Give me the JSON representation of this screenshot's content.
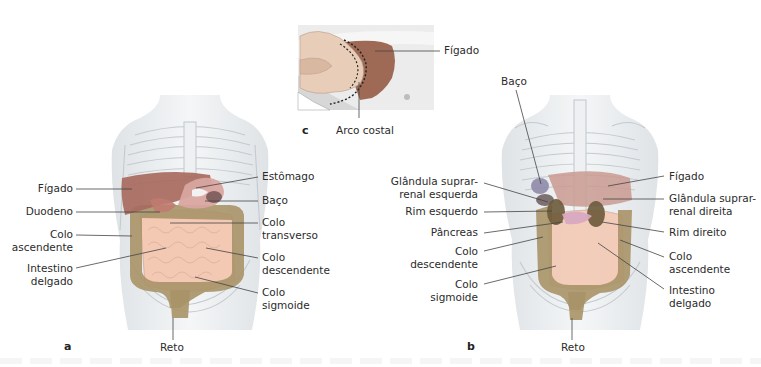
{
  "figure": {
    "panels": {
      "a": {
        "letter": "a",
        "labels_left": [
          {
            "id": "figado",
            "text": "Fígado"
          },
          {
            "id": "duodeno",
            "text": "Duodeno"
          },
          {
            "id": "colo_ascendente",
            "line1": "Colo",
            "line2": "ascendente"
          },
          {
            "id": "intestino_delgado",
            "line1": "Intestino",
            "line2": "delgado"
          }
        ],
        "labels_right": [
          {
            "id": "estomago",
            "text": "Estômago"
          },
          {
            "id": "baco",
            "text": "Baço"
          },
          {
            "id": "colo_transverso",
            "line1": "Colo",
            "line2": "transverso"
          },
          {
            "id": "colo_descendente",
            "line1": "Colo",
            "line2": "descendente"
          },
          {
            "id": "colo_sigmoide",
            "line1": "Colo",
            "line2": "sigmoide"
          }
        ],
        "label_bottom": {
          "id": "reto",
          "text": "Reto"
        }
      },
      "b": {
        "letter": "b",
        "label_top": {
          "id": "baco",
          "text": "Baço"
        },
        "labels_left": [
          {
            "id": "glandula_suprarrenal_esquerda",
            "line1": "Glândula suprar-",
            "line2": "renal esquerda"
          },
          {
            "id": "rim_esquerdo",
            "text": "Rim esquerdo"
          },
          {
            "id": "pancreas",
            "text": "Pâncreas"
          },
          {
            "id": "colo_descendente",
            "line1": "Colo",
            "line2": "descendente"
          },
          {
            "id": "colo_sigmoide",
            "line1": "Colo",
            "line2": "sigmoide"
          }
        ],
        "labels_right": [
          {
            "id": "figado",
            "text": "Fígado"
          },
          {
            "id": "glandula_suprarrenal_direita",
            "line1": "Glândula suprar-",
            "line2": "renal direita"
          },
          {
            "id": "rim_direito",
            "text": "Rim direito"
          },
          {
            "id": "colo_ascendente",
            "line1": "Colo",
            "line2": "ascendente"
          },
          {
            "id": "intestino_delgado",
            "line1": "Intestino",
            "line2": "delgado"
          }
        ],
        "label_bottom": {
          "id": "reto",
          "text": "Reto"
        }
      },
      "c": {
        "letter": "c",
        "label_right": {
          "id": "figado",
          "text": "Fígado"
        },
        "label_bottom": {
          "id": "arco_costal",
          "text": "Arco costal"
        }
      }
    },
    "colors": {
      "liver": "#a86a5e",
      "stomach": "#d9a5a0",
      "spleen": "#7a5a5a",
      "colon": "#a89468",
      "small_intestine": "#f3c9b4",
      "kidney": "#6b5a3a",
      "pancreas": "#d8a8c0",
      "adrenal": "#8e8aa8",
      "skeleton": "#c8cdd2",
      "body": "#e9ecef",
      "leader_line": "#444444"
    }
  }
}
